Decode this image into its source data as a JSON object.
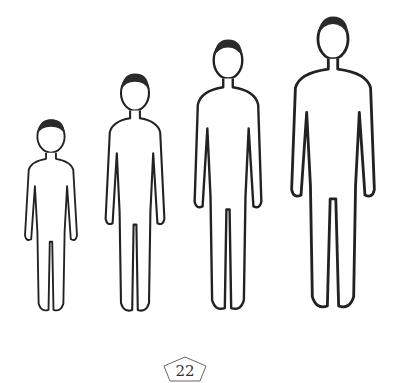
{
  "illustration": {
    "description": "Four standing outline figures of increasing height, left to right",
    "figures": [
      {
        "id": "stage-1",
        "x": 20,
        "top": 118,
        "height": 198,
        "width": 62
      },
      {
        "id": "stage-2",
        "x": 100,
        "top": 72,
        "height": 245,
        "width": 70
      },
      {
        "id": "stage-3",
        "x": 188,
        "top": 38,
        "height": 278,
        "width": 80
      },
      {
        "id": "stage-4",
        "x": 286,
        "top": 14,
        "height": 302,
        "width": 94
      }
    ]
  },
  "page": {
    "number": "22"
  }
}
